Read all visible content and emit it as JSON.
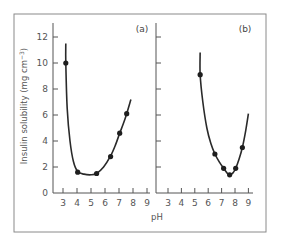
{
  "chart_data": {
    "type": "line",
    "title": "",
    "xlabel": "pH",
    "ylabel": "Insulin solubility (mg cm⁻³)",
    "ylim": [
      0,
      13
    ],
    "xlim": [
      2.7,
      9.3
    ],
    "grid": false,
    "legend": null,
    "y_ticks": [
      0,
      2,
      4,
      6,
      8,
      10,
      12
    ],
    "x_ticks": [
      3,
      4,
      5,
      6,
      7,
      8,
      9
    ],
    "panels": [
      {
        "label": "(a)",
        "points": [
          {
            "x": 3.2,
            "y": 10.0
          },
          {
            "x": 4.05,
            "y": 1.6
          },
          {
            "x": 5.4,
            "y": 1.5
          },
          {
            "x": 6.4,
            "y": 2.8
          },
          {
            "x": 7.05,
            "y": 4.6
          },
          {
            "x": 7.55,
            "y": 6.1
          }
        ],
        "curve": [
          {
            "x": 3.2,
            "y": 11.5
          },
          {
            "x": 3.2,
            "y": 10.0
          },
          {
            "x": 3.3,
            "y": 6.5
          },
          {
            "x": 3.5,
            "y": 4.0
          },
          {
            "x": 3.75,
            "y": 2.4
          },
          {
            "x": 4.05,
            "y": 1.65
          },
          {
            "x": 4.5,
            "y": 1.45
          },
          {
            "x": 5.0,
            "y": 1.4
          },
          {
            "x": 5.4,
            "y": 1.5
          },
          {
            "x": 5.9,
            "y": 2.0
          },
          {
            "x": 6.4,
            "y": 2.85
          },
          {
            "x": 6.75,
            "y": 3.7
          },
          {
            "x": 7.05,
            "y": 4.6
          },
          {
            "x": 7.3,
            "y": 5.3
          },
          {
            "x": 7.55,
            "y": 6.1
          },
          {
            "x": 7.85,
            "y": 7.2
          }
        ]
      },
      {
        "label": "(b)",
        "points": [
          {
            "x": 5.4,
            "y": 9.1
          },
          {
            "x": 6.5,
            "y": 3.0
          },
          {
            "x": 7.15,
            "y": 1.9
          },
          {
            "x": 7.6,
            "y": 1.4
          },
          {
            "x": 8.05,
            "y": 1.9
          },
          {
            "x": 8.55,
            "y": 3.5
          }
        ],
        "curve": [
          {
            "x": 5.4,
            "y": 10.8
          },
          {
            "x": 5.4,
            "y": 9.1
          },
          {
            "x": 5.6,
            "y": 7.0
          },
          {
            "x": 5.9,
            "y": 5.0
          },
          {
            "x": 6.2,
            "y": 3.8
          },
          {
            "x": 6.5,
            "y": 3.0
          },
          {
            "x": 6.85,
            "y": 2.35
          },
          {
            "x": 7.15,
            "y": 1.9
          },
          {
            "x": 7.4,
            "y": 1.55
          },
          {
            "x": 7.6,
            "y": 1.4
          },
          {
            "x": 7.85,
            "y": 1.55
          },
          {
            "x": 8.05,
            "y": 1.9
          },
          {
            "x": 8.3,
            "y": 2.6
          },
          {
            "x": 8.55,
            "y": 3.5
          },
          {
            "x": 8.8,
            "y": 4.8
          },
          {
            "x": 9.0,
            "y": 6.1
          }
        ]
      }
    ]
  },
  "labels": {
    "panel_a": "(a)",
    "panel_b": "(b)",
    "x_axis": "pH",
    "y_axis": "Insulin solubility (mg cm",
    "y_axis_sup": "−3",
    "y_axis_close": ")"
  },
  "style": {
    "line_color": "#2a2a2a",
    "marker_color": "#1e1e1e",
    "axis_color": "#555555",
    "frame_color": "#8a8a8a"
  }
}
